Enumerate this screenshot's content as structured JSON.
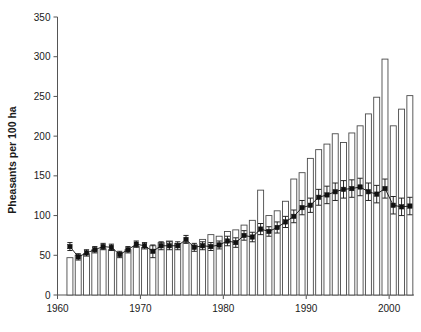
{
  "chart_data": {
    "type": "bar",
    "title": "",
    "xlabel": "",
    "ylabel": "Pheasants per 100 ha",
    "xlim": [
      1960,
      2003
    ],
    "ylim": [
      0,
      350
    ],
    "grid": false,
    "legend": "none",
    "y_ticks": [
      0,
      50,
      100,
      150,
      200,
      250,
      300,
      350
    ],
    "y_tick_labels": [
      "0",
      "50",
      "100",
      "150",
      "200",
      "250",
      "300",
      "350"
    ],
    "x_ticks": [
      1960,
      1970,
      1980,
      1990,
      2000
    ],
    "x_tick_labels": [
      "1960",
      "1970",
      "1980",
      "1990",
      "2000"
    ],
    "x_minor_tick_step": 1,
    "categories": [
      1961,
      1962,
      1963,
      1964,
      1965,
      1966,
      1967,
      1968,
      1969,
      1970,
      1971,
      1972,
      1973,
      1974,
      1975,
      1976,
      1977,
      1978,
      1979,
      1980,
      1981,
      1982,
      1983,
      1984,
      1985,
      1986,
      1987,
      1988,
      1989,
      1990,
      1991,
      1992,
      1993,
      1994,
      1995,
      1996,
      1997,
      1998,
      1999,
      2000,
      2001,
      2002
    ],
    "series": [
      {
        "name": "Bar counts",
        "render": "bar",
        "values": [
          47,
          50,
          52,
          57,
          58,
          57,
          53,
          57,
          61,
          60,
          62,
          66,
          68,
          65,
          66,
          63,
          70,
          76,
          74,
          80,
          82,
          88,
          94,
          132,
          100,
          106,
          118,
          146,
          154,
          172,
          183,
          190,
          203,
          192,
          204,
          213,
          228,
          249,
          297,
          213,
          234,
          251
        ]
      },
      {
        "name": "Mean density",
        "render": "line-markers-errorbars",
        "values": [
          61,
          48,
          53,
          57,
          61,
          60,
          51,
          57,
          64,
          62,
          55,
          62,
          62,
          62,
          70,
          60,
          62,
          61,
          63,
          68,
          66,
          75,
          73,
          83,
          80,
          85,
          92,
          99,
          110,
          113,
          123,
          126,
          130,
          133,
          134,
          136,
          130,
          127,
          134,
          113,
          111,
          112
        ],
        "err_low": [
          5,
          4,
          4,
          4,
          4,
          4,
          4,
          4,
          4,
          4,
          8,
          5,
          5,
          5,
          5,
          5,
          5,
          5,
          5,
          6,
          6,
          6,
          6,
          7,
          6,
          7,
          7,
          8,
          9,
          9,
          10,
          11,
          11,
          11,
          11,
          11,
          11,
          11,
          12,
          11,
          11,
          11
        ],
        "err_high": [
          5,
          4,
          4,
          4,
          4,
          4,
          4,
          4,
          4,
          4,
          8,
          5,
          5,
          5,
          5,
          5,
          5,
          5,
          5,
          6,
          6,
          6,
          6,
          7,
          6,
          7,
          7,
          8,
          9,
          9,
          10,
          11,
          11,
          11,
          11,
          11,
          11,
          11,
          12,
          11,
          11,
          11
        ]
      }
    ],
    "colors": {
      "bar_fill": "#ffffff",
      "bar_edge": "#4a4a4a",
      "marker": "#111111",
      "axis": "#555555",
      "text": "#1a1a1a"
    }
  }
}
